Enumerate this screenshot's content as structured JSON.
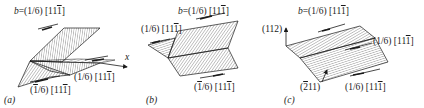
{
  "figure": {
    "panels": [
      {
        "id": "a",
        "caption": "(a)",
        "labels": {
          "burgers_vector": "b = (1/6) [11̅1]",
          "right_partial": "(1/6) [11̅1]",
          "bottom_partial": "(1̅/6) [11̅1]",
          "axis": "x"
        }
      },
      {
        "id": "b",
        "caption": "(b)",
        "labels": {
          "burgers_vector": "b = (1/6) [111̅]",
          "left_partial": "(1/6) [111̅]",
          "bottom_partial": "(1̅/6) [11̅1]"
        }
      },
      {
        "id": "c",
        "caption": "(c)",
        "labels": {
          "burgers_vector": "b = (1/6) [111̅]",
          "plane_top": "(112)",
          "right_partial": "(1/6) [111̅]",
          "plane_bottom": "(2̅11)",
          "bottom_partial": "(1/6) [111̅]"
        }
      }
    ]
  },
  "text": {
    "a_b": "b",
    "a_b_rest": "=(1/6) [11",
    "a_b_bar": "1",
    "a_b_end": "]",
    "a_right_pre": "(1/6) [11",
    "a_right_bar": "1",
    "a_right_end": "]",
    "a_bottom_pre": "(",
    "a_bottom_bar1": "1",
    "a_bottom_mid": "/6) [11",
    "a_bottom_bar2": "1",
    "a_bottom_end": "]",
    "a_axis": "x",
    "a_caption": "(a)",
    "b_b": "b",
    "b_b_rest": "=(1/6) [11",
    "b_b_bar": "1",
    "b_b_end": "]",
    "b_left_pre": "(1/6) [11",
    "b_left_bar": "1",
    "b_left_end": "]",
    "b_bottom_pre": "(",
    "b_bottom_bar1": "1",
    "b_bottom_mid": "/6) [11",
    "b_bottom_bar2": "1",
    "b_bottom_end": "]",
    "b_caption": "(b)",
    "c_b": "b",
    "c_b_rest": "=(1/6) [11",
    "c_b_bar": "1",
    "c_b_end": "]",
    "c_top_plane": "(112)",
    "c_right_pre": "(1/6) [11",
    "c_right_bar": "1",
    "c_right_end": "]",
    "c_bottom_plane_pre": "(",
    "c_bottom_plane_bar": "2",
    "c_bottom_plane_end": "11)",
    "c_bottom_pre": "(1/6) [11",
    "c_bottom_bar": "1",
    "c_bottom_end": "]",
    "c_caption": "(c)"
  },
  "colors": {
    "ink": "#1a1a1a",
    "background": "#ffffff"
  }
}
